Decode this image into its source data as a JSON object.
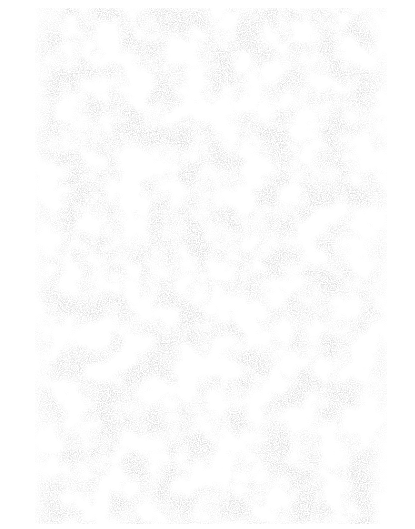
{
  "page": {
    "description": "Blank speckled paper texture",
    "background_color": "#ffffff",
    "speckle_color": "#b8b8b8"
  },
  "texture": {
    "region": {
      "left": 35,
      "top": 8,
      "width": 352,
      "height": 516
    },
    "text_content": ""
  }
}
